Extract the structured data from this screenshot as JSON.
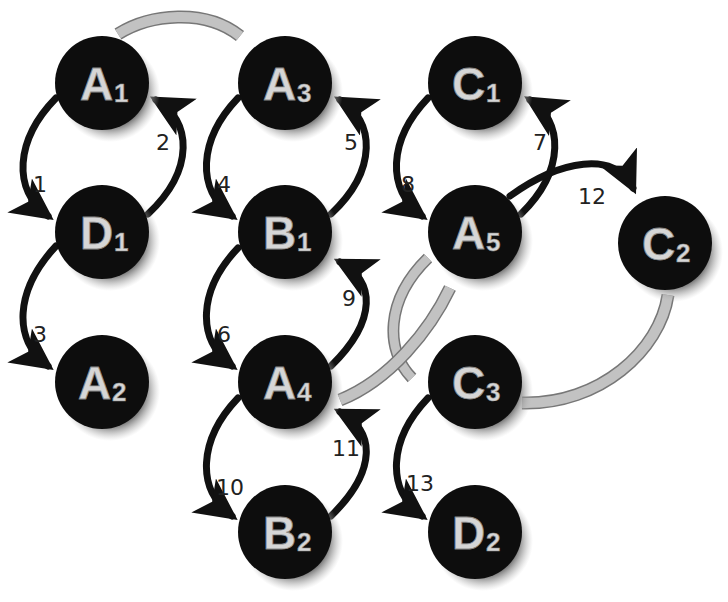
{
  "colors": {
    "node_fill": "#0d0d0d",
    "node_text": "#d6d6d6",
    "shadow": "#8c8c8c",
    "edge": "#111111",
    "gray_link": "#b9b9b9",
    "background": "#ffffff"
  },
  "nodes": [
    {
      "id": "A1",
      "letter": "A",
      "sub": "1",
      "cx": 102,
      "cy": 83
    },
    {
      "id": "D1",
      "letter": "D",
      "sub": "1",
      "cx": 102,
      "cy": 232
    },
    {
      "id": "A2",
      "letter": "A",
      "sub": "2",
      "cx": 102,
      "cy": 382
    },
    {
      "id": "A3",
      "letter": "A",
      "sub": "3",
      "cx": 285,
      "cy": 83
    },
    {
      "id": "B1",
      "letter": "B",
      "sub": "1",
      "cx": 285,
      "cy": 232
    },
    {
      "id": "A4",
      "letter": "A",
      "sub": "4",
      "cx": 285,
      "cy": 382
    },
    {
      "id": "B2",
      "letter": "B",
      "sub": "2",
      "cx": 285,
      "cy": 532
    },
    {
      "id": "C1",
      "letter": "C",
      "sub": "1",
      "cx": 475,
      "cy": 83
    },
    {
      "id": "A5",
      "letter": "A",
      "sub": "5",
      "cx": 475,
      "cy": 232
    },
    {
      "id": "C2",
      "letter": "C",
      "sub": "2",
      "cx": 665,
      "cy": 243
    },
    {
      "id": "C3",
      "letter": "C",
      "sub": "3",
      "cx": 475,
      "cy": 382
    },
    {
      "id": "D2",
      "letter": "D",
      "sub": "2",
      "cx": 475,
      "cy": 532
    }
  ],
  "edges": [
    {
      "label": "1",
      "from": "A1",
      "to": "D1"
    },
    {
      "label": "2",
      "from": "D1",
      "to": "A1"
    },
    {
      "label": "3",
      "from": "D1",
      "to": "A2"
    },
    {
      "label": "4",
      "from": "A3",
      "to": "B1"
    },
    {
      "label": "5",
      "from": "B1",
      "to": "A3"
    },
    {
      "label": "6",
      "from": "B1",
      "to": "A4"
    },
    {
      "label": "7",
      "from": "A5",
      "to": "C1"
    },
    {
      "label": "8",
      "from": "C1",
      "to": "A5"
    },
    {
      "label": "9",
      "from": "A4",
      "to": "B1"
    },
    {
      "label": "10",
      "from": "A4",
      "to": "B2"
    },
    {
      "label": "11",
      "from": "B2",
      "to": "A4"
    },
    {
      "label": "12",
      "from": "A5",
      "to": "C2"
    },
    {
      "label": "13",
      "from": "C3",
      "to": "D2"
    }
  ],
  "gray_links": [
    {
      "from": "A1",
      "to": "A3"
    },
    {
      "from": "A5",
      "to": "C3"
    },
    {
      "from": "A5",
      "to": "A4"
    },
    {
      "from": "C2",
      "to": "C3"
    }
  ]
}
